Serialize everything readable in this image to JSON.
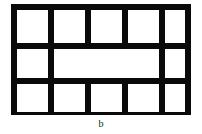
{
  "figure": {
    "caption": "b",
    "colors": {
      "background": "#ffffff",
      "strut": "#0a0a0a",
      "cell_fill": "#ffffff",
      "caption_text": "#1a1a1a"
    },
    "frame": {
      "left": 11,
      "top": 4,
      "width": 180,
      "height": 111,
      "strut_thickness": 6
    },
    "layout": {
      "columns": 5,
      "rows": 3,
      "merged_cells": "middle row columns 2-4 merged into one wide cell"
    },
    "rows": [
      {
        "name": "top-row",
        "top": 6,
        "height": 33,
        "cells": [
          {
            "name": "cell-r1c1",
            "left": 6,
            "width": 31
          },
          {
            "name": "cell-r1c2",
            "left": 43,
            "width": 31
          },
          {
            "name": "cell-r1c3",
            "left": 80,
            "width": 31
          },
          {
            "name": "cell-r1c4",
            "left": 117,
            "width": 31
          },
          {
            "name": "cell-r1c5",
            "left": 154,
            "width": 20
          }
        ]
      },
      {
        "name": "middle-row",
        "top": 45,
        "height": 29,
        "cells": [
          {
            "name": "cell-r2c1",
            "left": 6,
            "width": 31
          },
          {
            "name": "cell-r2-merged",
            "left": 43,
            "width": 105
          },
          {
            "name": "cell-r2c5",
            "left": 154,
            "width": 20
          }
        ]
      },
      {
        "name": "bottom-row",
        "top": 80,
        "height": 28,
        "cells": [
          {
            "name": "cell-r3c1",
            "left": 6,
            "width": 31
          },
          {
            "name": "cell-r3c2",
            "left": 43,
            "width": 31
          },
          {
            "name": "cell-r3c3",
            "left": 80,
            "width": 31
          },
          {
            "name": "cell-r3c4",
            "left": 117,
            "width": 31
          },
          {
            "name": "cell-r3c5",
            "left": 154,
            "width": 20
          }
        ]
      }
    ]
  }
}
